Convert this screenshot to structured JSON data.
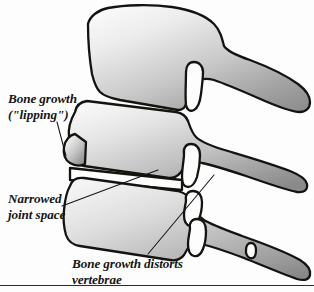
{
  "figure": {
    "background_color": "#fdfdfd",
    "outline_color": "#15130f",
    "text_color": "#161616",
    "width": 314,
    "height": 292
  },
  "annotations": [
    {
      "id": "bone-growth-lipping",
      "line1": "Bone growth",
      "line2": "(\"lipping\")",
      "x": 8,
      "y1": 103,
      "y2": 119,
      "leader": "M 57,122 L 66,156"
    },
    {
      "id": "narrowed-joint-space",
      "line1": "Narrowed",
      "line2": "joint space",
      "x": 8,
      "y1": 203,
      "y2": 219,
      "leader": "M 62,206 L 158,170"
    },
    {
      "id": "bone-growth-distorts-vertebrae",
      "line1": "Bone growth distorts",
      "line2": "vertebrae",
      "x": 72,
      "y1": 268,
      "y2": 284,
      "leader": "M 148,254 L 214,175"
    }
  ],
  "vertebrae": [
    {
      "id": "upper-vertebra",
      "label": "Upper vertebra body with spinous process",
      "shading_light": "#f2f2f2",
      "shading_dark": "#949494"
    },
    {
      "id": "middle-vertebra",
      "label": "Middle vertebra with anterior lipping osteophyte",
      "shading_light": "#f2f2f2",
      "shading_dark": "#8f8f8f"
    },
    {
      "id": "lower-vertebra",
      "label": "Lower vertebra distorted by bone growth",
      "shading_light": "#f0f0f0",
      "shading_dark": "#8c8c8c"
    }
  ],
  "footer_rule": {
    "id": "bottom-rule",
    "y": 285
  }
}
